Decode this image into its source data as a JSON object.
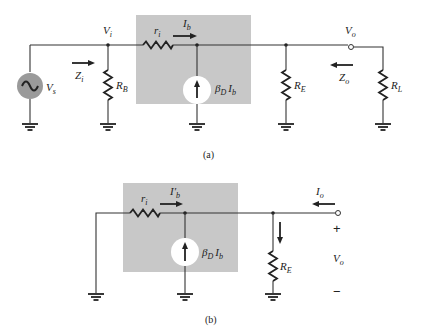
{
  "figure": {
    "a": {
      "caption": "(a)",
      "labels": {
        "vs": "V",
        "vs_sub": "s",
        "vi": "V",
        "vi_sub": "i",
        "zi": "Z",
        "zi_sub": "i",
        "rb": "R",
        "rb_sub": "B",
        "ri": "r",
        "ri_sub": "i",
        "ib": "I",
        "ib_sub": "b",
        "src": "β",
        "src_sub": "D",
        "src_i": "I",
        "src_i_sub": "b",
        "re": "R",
        "re_sub": "E",
        "zo": "Z",
        "zo_sub": "o",
        "vo": "V",
        "vo_sub": "o",
        "rl": "R",
        "rl_sub": "L"
      }
    },
    "b": {
      "caption": "(b)",
      "labels": {
        "ri": "r",
        "ri_sub": "i",
        "ib": "I′",
        "ib_sub": "b",
        "src": "β",
        "src_sub": "D",
        "src_i": "I",
        "src_i_sub": "b",
        "re": "R",
        "re_sub": "E",
        "io": "I",
        "io_sub": "o",
        "plus": "+",
        "vo": "V",
        "vo_sub": "o",
        "minus": "−"
      }
    },
    "colors": {
      "box_fill": "#c8c8c8",
      "source_fill": "#9a9a9a",
      "wire": "#333333"
    }
  }
}
